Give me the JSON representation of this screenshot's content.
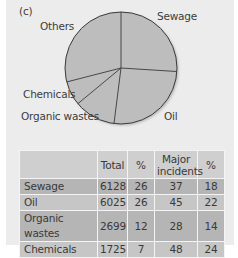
{
  "panel_label": "(c)",
  "chart_data": [
    {
      "type": "pie",
      "title": "(c)",
      "categories": [
        "Sewage",
        "Oil",
        "Organic wastes",
        "Chemicals",
        "Others"
      ],
      "values": [
        26,
        26,
        12,
        7,
        29
      ],
      "unit": "%",
      "start_angle": "12 o'clock, clockwise",
      "legend": "slice labels outside pie"
    },
    {
      "type": "table",
      "columns": [
        "",
        "Total",
        "%",
        "Major incidents",
        "%"
      ],
      "rows": [
        [
          "Sewage",
          6128,
          26,
          37,
          18
        ],
        [
          "Oil",
          6025,
          26,
          45,
          22
        ],
        [
          "Organic wastes",
          2699,
          12,
          28,
          14
        ],
        [
          "Chemicals",
          1725,
          7,
          48,
          24
        ]
      ]
    }
  ],
  "pie_labels": {
    "sewage": "Sewage",
    "oil": "Oil",
    "organic": "Organic wastes",
    "chemicals": "Chemicals",
    "others": "Others"
  },
  "colors": {
    "panel_bg": "#ececec",
    "pie_fill": "#bdbdbd",
    "pie_stroke": "#3a3a3a",
    "table_header": "#cfcfcf",
    "row_dark": "#b5b5b5",
    "row_light": "#c6c6c6"
  },
  "table": {
    "headers": {
      "name": "",
      "total": "Total",
      "pct1": "%",
      "major_line1": "Major",
      "major_line2": "incidents",
      "pct2": "%"
    },
    "rows": [
      {
        "name": "Sewage",
        "total": "6128",
        "pct1": "26",
        "major": "37",
        "pct2": "18"
      },
      {
        "name": "Oil",
        "total": "6025",
        "pct1": "26",
        "major": "45",
        "pct2": "22"
      },
      {
        "name": "Organic wastes",
        "total": "2699",
        "pct1": "12",
        "major": "28",
        "pct2": "14"
      },
      {
        "name": "Chemicals",
        "total": "1725",
        "pct1": "7",
        "major": "48",
        "pct2": "24"
      }
    ]
  }
}
